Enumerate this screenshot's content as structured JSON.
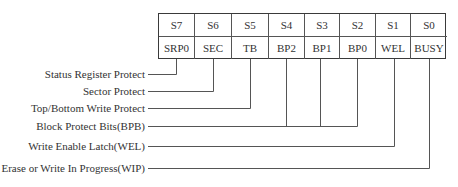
{
  "caption_clipped": "",
  "register": {
    "bits": [
      {
        "id": "S7",
        "name": "SRP0"
      },
      {
        "id": "S6",
        "name": "SEC"
      },
      {
        "id": "S5",
        "name": "TB"
      },
      {
        "id": "S4",
        "name": "BP2"
      },
      {
        "id": "S3",
        "name": "BP1"
      },
      {
        "id": "S2",
        "name": "BP0"
      },
      {
        "id": "S1",
        "name": "WEL"
      },
      {
        "id": "S0",
        "name": "BUSY"
      }
    ]
  },
  "labels": [
    {
      "text": "Status Register Protect",
      "bits": [
        "SRP0"
      ]
    },
    {
      "text": "Sector Protect",
      "bits": [
        "SEC"
      ]
    },
    {
      "text": "Top/Bottom Write Protect",
      "bits": [
        "TB"
      ]
    },
    {
      "text": "Block Protect Bits(BPB)",
      "bits": [
        "BP2",
        "BP1",
        "BP0"
      ]
    },
    {
      "text": "Write Enable Latch(WEL)",
      "bits": [
        "WEL"
      ]
    },
    {
      "text": "Erase or Write In Progress(WIP)",
      "bits": [
        "BUSY"
      ]
    }
  ],
  "colors": {
    "line": "#555555",
    "text": "#333333",
    "border": "#3a3a3a"
  }
}
